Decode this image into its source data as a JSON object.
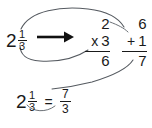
{
  "diagram": {
    "background_color": "#ffffff",
    "ink_color": "#1a1a1a",
    "arc_color": "#555a60"
  },
  "mixed_number": {
    "whole": "2",
    "numerator": "1",
    "denominator": "3"
  },
  "arrow": {
    "glyph": "⟶",
    "direction": "right"
  },
  "multiply_step": {
    "top": "2",
    "operator": "x",
    "operand": "3",
    "result": "6"
  },
  "add_step": {
    "top": "6",
    "operator": "+",
    "operand": "1",
    "result": "7"
  },
  "result_equation": {
    "whole": "2",
    "numerator": "1",
    "denominator": "3",
    "equals": "=",
    "result_numerator": "7",
    "result_denominator": "3"
  },
  "arcs": [
    {
      "name": "whole-to-multiplier",
      "from": "whole 2",
      "to": "x 3 multiplicand"
    },
    {
      "name": "denominator-to-multiplier",
      "from": "denominator 3",
      "to": "multiplication column"
    },
    {
      "name": "product-to-addend",
      "from": "product 6",
      "to": "addition column 6"
    },
    {
      "name": "numerator-to-addend",
      "from": "numerator 1",
      "to": "+ 1 addend"
    },
    {
      "name": "sum-to-result-numerator",
      "from": "sum 7",
      "to": "improper fraction numerator 7"
    },
    {
      "name": "denominator-carry",
      "from": "mixed number denominator 3",
      "to": "result denominator 3"
    }
  ]
}
